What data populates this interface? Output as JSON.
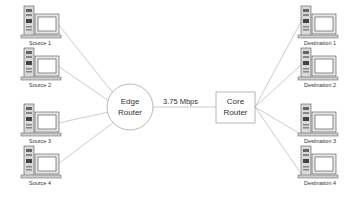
{
  "diagram": {
    "sources": [
      {
        "label": "Source 1"
      },
      {
        "label": "Source 2"
      },
      {
        "label": "Source 3"
      },
      {
        "label": "Source 4"
      }
    ],
    "destinations": [
      {
        "label": "Destination 1"
      },
      {
        "label": "Destination 2"
      },
      {
        "label": "Destination 3"
      },
      {
        "label": "Destination 4"
      }
    ],
    "edge_router": {
      "line1": "Edge",
      "line2": "Router",
      "shape": "circle"
    },
    "core_router": {
      "line1": "Core",
      "line2": "Router",
      "shape": "rectangle"
    },
    "bottleneck_link": {
      "label": "3.75 Mbps"
    },
    "colors": {
      "line": "#bfbfbf",
      "node_border": "#a6a6a6",
      "text": "#333333"
    }
  }
}
